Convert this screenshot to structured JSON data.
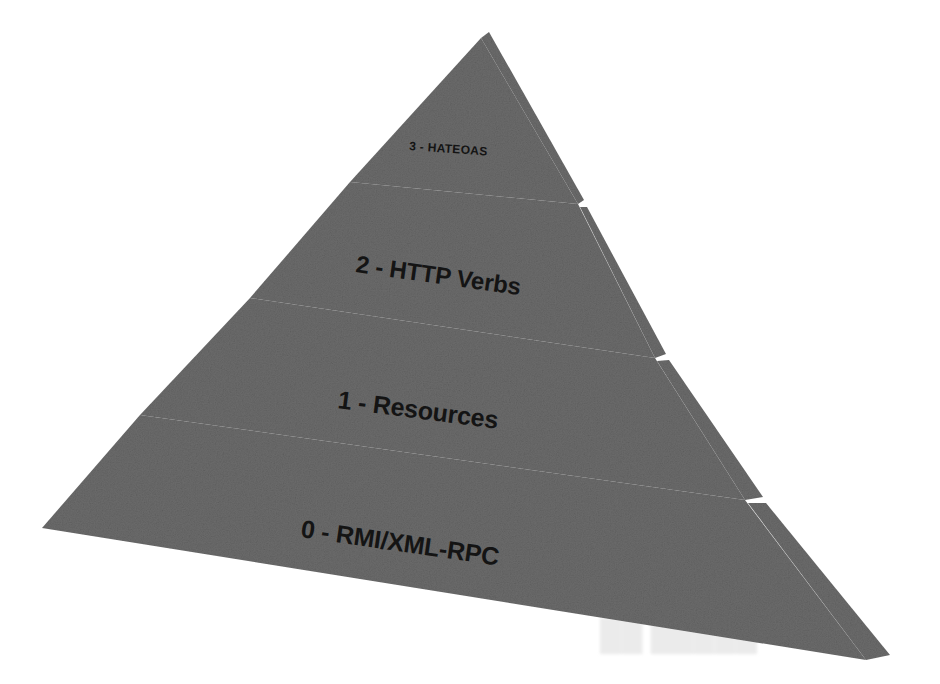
{
  "diagram": {
    "type": "pyramid",
    "background_color": "#ffffff",
    "face_color": "#6b6b6b",
    "separator_color": "#ffffff",
    "label_color": "#141414",
    "tiers": [
      {
        "level": "3",
        "label": "3 - HATEOAS",
        "position": "top"
      },
      {
        "level": "2",
        "label": "2 - HTTP Verbs",
        "position": "upper-middle"
      },
      {
        "level": "1",
        "label": "1 - Resources",
        "position": "lower-middle"
      },
      {
        "level": "0",
        "label": "0 - RMI/XML-RPC",
        "position": "bottom"
      }
    ],
    "artifact": {
      "ghost_text": "scan-bleed"
    }
  }
}
